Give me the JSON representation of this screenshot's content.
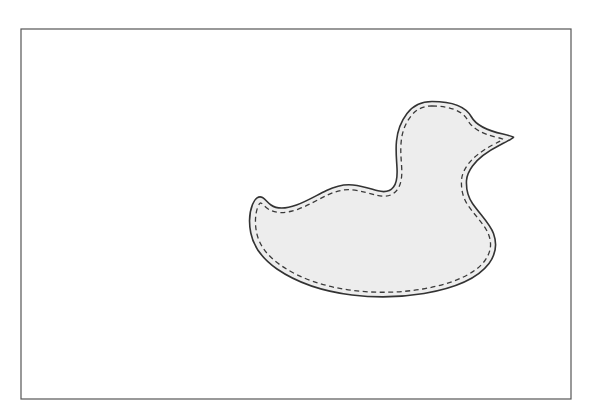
{
  "page": {
    "width": 593,
    "height": 418,
    "background_color": "#ffffff"
  },
  "frame": {
    "name": "page-border",
    "x": 21,
    "y": 29,
    "width": 550,
    "height": 370,
    "stroke_color": "#555555",
    "stroke_width": 1.2,
    "fill": "none"
  },
  "duck": {
    "label": "duck-pattern-shape",
    "fill_color": "#ededed",
    "outline_color": "#333333",
    "outline_width": 1.6,
    "stitch_color": "#3a3a3a",
    "stitch_width": 1.3,
    "stitch_dash": "5 3.5",
    "stitch_inset": 4,
    "bounds": {
      "left": 250,
      "top": 101,
      "right": 514,
      "bottom": 297
    },
    "key_points": {
      "head_top": [
        432,
        102
      ],
      "beak_tip": [
        513,
        137
      ],
      "throat_notch": [
        468,
        176
      ],
      "body_right": [
        495,
        233
      ],
      "body_bottom": [
        370,
        296
      ],
      "tail_tip": [
        250,
        199
      ],
      "back_saddle": [
        330,
        190
      ],
      "neck_back": [
        398,
        145
      ]
    },
    "outline_path": "M 432.0 101.5 C 452.0 101.5 466.0 107.0 471.5 117.0 C 476.0 125.2 487.0 130.5 503.0 134.0 C 509.0 135.4 512.5 136.4 513.5 137.2 C 512.4 138.6 508.0 141.0 500.0 145.0 C 487.0 151.6 477.5 159.0 472.5 166.0 C 468.5 171.6 466.8 175.6 466.5 180.5 C 466.0 189.5 468.0 197.0 472.5 203.5 C 481.0 215.5 490.0 224.0 493.5 233.5 C 497.5 244.5 496.0 254.0 489.0 263.5 C 478.5 277.5 456.0 288.0 424.0 293.5 C 400.0 297.5 375.0 297.8 352.0 295.0 C 322.0 291.3 296.0 282.0 277.0 269.0 C 262.0 258.5 253.5 246.5 250.8 233.0 C 248.8 223.0 249.3 212.5 252.5 204.5 C 255.0 198.2 258.8 195.5 262.5 197.5 C 265.5 199.2 267.5 202.5 271.0 205.0 C 277.0 209.2 286.0 208.8 296.5 205.0 C 307.5 201.0 317.0 195.0 326.5 190.5 C 336.0 186.0 345.0 184.0 353.0 185.0 C 363.0 186.2 371.0 189.0 378.0 190.8 C 384.5 192.5 390.0 191.5 393.5 187.0 C 396.5 183.2 397.5 177.0 397.0 168.0 C 396.5 158.5 395.5 150.0 396.5 141.0 C 397.5 131.0 400.5 122.0 407.0 113.5 C 412.5 106.2 420.5 101.5 432.0 101.5 Z",
    "stitch_path": "M 431.8 106.0 C 450.0 106.0 462.8 111.0 467.6 120.0 C 472.2 128.5 482.5 134.0 497.0 137.4 C 500.5 138.2 502.5 138.8 503.0 139.3 C 502.0 140.4 498.5 142.0 493.5 144.5 C 481.5 150.8 472.5 158.0 467.8 164.6 C 463.6 170.5 461.8 175.2 461.5 180.5 C 461.0 190.4 463.3 198.6 468.2 205.7 C 476.5 217.4 485.3 225.6 488.6 234.5 C 492.2 244.3 490.8 252.5 484.6 261.0 C 475.0 273.8 453.5 283.7 422.8 289.0 C 399.5 292.9 375.3 293.2 353.0 290.5 C 324.0 286.9 299.2 278.0 281.0 265.5 C 267.0 255.8 259.0 244.8 256.5 232.2 C 254.7 223.0 255.2 213.5 258.0 206.5 C 259.2 203.5 260.2 202.6 261.3 203.2 C 262.8 204.0 264.5 206.3 267.5 208.5 C 275.0 214.0 285.8 213.5 297.8 209.3 C 309.0 205.2 318.4 199.3 327.6 195.0 C 336.4 190.8 344.6 189.0 352.4 189.9 C 362.0 191.0 370.0 193.7 377.0 195.4 C 385.6 197.5 392.8 195.8 397.2 189.8 C 401.0 184.7 402.2 177.4 401.7 168.0 C 401.2 158.6 400.2 150.3 401.2 141.6 C 402.1 132.2 404.9 124.0 410.8 116.3 C 415.7 109.8 422.3 106.0 431.8 106.0 Z"
  }
}
